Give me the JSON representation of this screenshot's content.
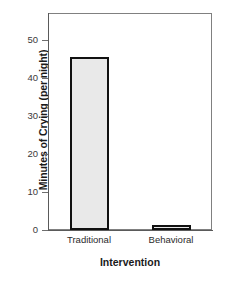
{
  "chart_data": {
    "type": "bar",
    "title": "",
    "subtitle": "",
    "categories": [
      "Traditional",
      "Behavioral"
    ],
    "values": [
      45.5,
      1
    ],
    "xlabel": "Intervention",
    "ylabel": "Minutes of Crying (per night)",
    "ylim": [
      0,
      57
    ],
    "yticks": [
      0,
      10,
      20,
      30,
      40,
      50
    ],
    "ytick_labels": [
      "0",
      "10",
      "20",
      "30",
      "40",
      "50"
    ],
    "grid": false,
    "legend": null,
    "annotations": [],
    "colors": {
      "bar_fill": "#e9e9e9",
      "bar_edge": "#111111",
      "frame": "#808080",
      "axis": "#5a5a5a",
      "text": "#1a1a1a",
      "background": "#ffffff"
    }
  }
}
